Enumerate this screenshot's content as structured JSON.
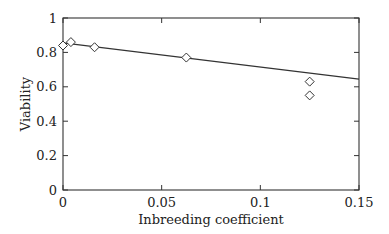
{
  "chart_data": {
    "type": "scatter",
    "title": "",
    "xlabel": "Inbreeding coefficient",
    "ylabel": "Viability",
    "xlim": [
      0,
      0.15
    ],
    "ylim": [
      0,
      1
    ],
    "grid": false,
    "legend": null,
    "x_ticks": [
      0,
      0.05,
      0.1,
      0.15
    ],
    "x_tick_labels": [
      "0",
      "0.05",
      "0.1",
      "0.15"
    ],
    "y_ticks": [
      0,
      0.2,
      0.4,
      0.6,
      0.8,
      1
    ],
    "y_tick_labels": [
      "0",
      "0.2",
      "0.4",
      "0.6",
      "0.8",
      "1"
    ],
    "series": [
      {
        "name": "observed",
        "marker": "diamond-open",
        "points": [
          {
            "x": 0.0,
            "y": 0.84
          },
          {
            "x": 0.004,
            "y": 0.86
          },
          {
            "x": 0.016,
            "y": 0.83
          },
          {
            "x": 0.0625,
            "y": 0.77
          },
          {
            "x": 0.125,
            "y": 0.63
          },
          {
            "x": 0.125,
            "y": 0.55
          }
        ]
      },
      {
        "name": "fit",
        "type": "line",
        "points": [
          {
            "x": 0.0,
            "y": 0.855
          },
          {
            "x": 0.15,
            "y": 0.645
          }
        ]
      }
    ]
  },
  "colors": {
    "axis": "#333333",
    "marker": "#333333",
    "line": "#333333",
    "background": "#ffffff"
  }
}
